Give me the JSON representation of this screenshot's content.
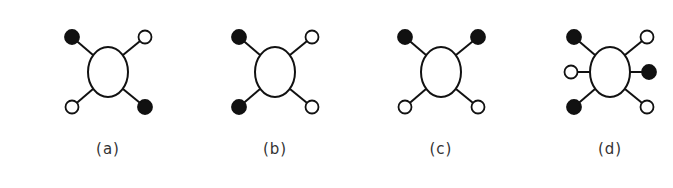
{
  "figure": {
    "panels": [
      {
        "label": "(a)",
        "center": [
          108,
          72
        ],
        "substituents": [
          {
            "position": "top-left",
            "fill": "filled"
          },
          {
            "position": "top-right",
            "fill": "open"
          },
          {
            "position": "bottom-left",
            "fill": "open"
          },
          {
            "position": "bottom-right",
            "fill": "filled"
          }
        ]
      },
      {
        "label": "(b)",
        "center": [
          275,
          72
        ],
        "substituents": [
          {
            "position": "top-left",
            "fill": "filled"
          },
          {
            "position": "top-right",
            "fill": "open"
          },
          {
            "position": "bottom-left",
            "fill": "filled"
          },
          {
            "position": "bottom-right",
            "fill": "open"
          }
        ]
      },
      {
        "label": "(c)",
        "center": [
          441,
          72
        ],
        "substituents": [
          {
            "position": "top-left",
            "fill": "filled"
          },
          {
            "position": "top-right",
            "fill": "filled"
          },
          {
            "position": "bottom-left",
            "fill": "open"
          },
          {
            "position": "bottom-right",
            "fill": "open"
          }
        ]
      },
      {
        "label": "(d)",
        "center": [
          610,
          72
        ],
        "substituents": [
          {
            "position": "top-left",
            "fill": "filled"
          },
          {
            "position": "top-right",
            "fill": "open"
          },
          {
            "position": "middle-left",
            "fill": "open"
          },
          {
            "position": "middle-right",
            "fill": "filled"
          },
          {
            "position": "bottom-left",
            "fill": "filled"
          },
          {
            "position": "bottom-right",
            "fill": "open"
          }
        ]
      }
    ],
    "colors": {
      "stroke": "#111111",
      "filled": "#111111",
      "open": "#ffffff",
      "label": "#333333"
    }
  }
}
